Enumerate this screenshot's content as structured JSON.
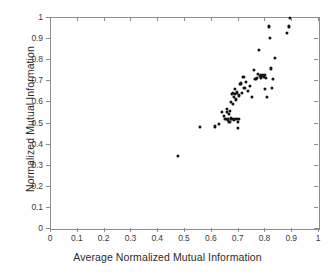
{
  "chart_data": {
    "type": "scatter",
    "title": "",
    "xlabel": "Average Normalized Mutual Information",
    "ylabel": "Normalized Mutual Information",
    "xlim": [
      0,
      1
    ],
    "ylim": [
      0,
      1
    ],
    "grid": false,
    "legend": null,
    "marker": {
      "shape": "circle",
      "color": "#141414",
      "size": 3
    },
    "xticks": [
      "0",
      "0.1",
      "0.2",
      "0.3",
      "0.4",
      "0.5",
      "0.6",
      "0.7",
      "0.8",
      "0.9",
      "1"
    ],
    "xtick_values": [
      0,
      0.1,
      0.2,
      0.3,
      0.4,
      0.5,
      0.6,
      0.7,
      0.8,
      0.9,
      1
    ],
    "yticks": [
      "0",
      "0.1",
      "0.2",
      "0.3",
      "0.4",
      "0.5",
      "0.6",
      "0.7",
      "0.8",
      "0.9",
      "1"
    ],
    "ytick_values": [
      0,
      0.1,
      0.2,
      0.3,
      0.4,
      0.5,
      0.6,
      0.7,
      0.8,
      0.9,
      1
    ],
    "points": [
      [
        0.475,
        0.345
      ],
      [
        0.556,
        0.483
      ],
      [
        0.612,
        0.486
      ],
      [
        0.627,
        0.497
      ],
      [
        0.639,
        0.556
      ],
      [
        0.646,
        0.537
      ],
      [
        0.651,
        0.52
      ],
      [
        0.655,
        0.553
      ],
      [
        0.658,
        0.571
      ],
      [
        0.661,
        0.519
      ],
      [
        0.663,
        0.546
      ],
      [
        0.666,
        0.508
      ],
      [
        0.668,
        0.56
      ],
      [
        0.67,
        0.524
      ],
      [
        0.672,
        0.604
      ],
      [
        0.674,
        0.638
      ],
      [
        0.676,
        0.521
      ],
      [
        0.678,
        0.646
      ],
      [
        0.68,
        0.594
      ],
      [
        0.682,
        0.627
      ],
      [
        0.684,
        0.519
      ],
      [
        0.686,
        0.664
      ],
      [
        0.688,
        0.641
      ],
      [
        0.69,
        0.614
      ],
      [
        0.692,
        0.523
      ],
      [
        0.694,
        0.647
      ],
      [
        0.696,
        0.509
      ],
      [
        0.698,
        0.479
      ],
      [
        0.7,
        0.633
      ],
      [
        0.702,
        0.521
      ],
      [
        0.706,
        0.687
      ],
      [
        0.71,
        0.69
      ],
      [
        0.714,
        0.646
      ],
      [
        0.718,
        0.722
      ],
      [
        0.722,
        0.668
      ],
      [
        0.728,
        0.699
      ],
      [
        0.735,
        0.655
      ],
      [
        0.742,
        0.679
      ],
      [
        0.749,
        0.627
      ],
      [
        0.757,
        0.754
      ],
      [
        0.763,
        0.712
      ],
      [
        0.768,
        0.718
      ],
      [
        0.772,
        0.736
      ],
      [
        0.776,
        0.847
      ],
      [
        0.779,
        0.724
      ],
      [
        0.782,
        0.73
      ],
      [
        0.785,
        0.718
      ],
      [
        0.788,
        0.726
      ],
      [
        0.791,
        0.731
      ],
      [
        0.794,
        0.722
      ],
      [
        0.797,
        0.665
      ],
      [
        0.8,
        0.729
      ],
      [
        0.803,
        0.715
      ],
      [
        0.807,
        0.626
      ],
      [
        0.812,
        0.96
      ],
      [
        0.816,
        0.905
      ],
      [
        0.82,
        0.761
      ],
      [
        0.823,
        0.669
      ],
      [
        0.827,
        0.712
      ],
      [
        0.834,
        0.809
      ],
      [
        0.882,
        0.928
      ],
      [
        0.887,
        0.96
      ],
      [
        0.891,
        0.999
      ]
    ]
  }
}
